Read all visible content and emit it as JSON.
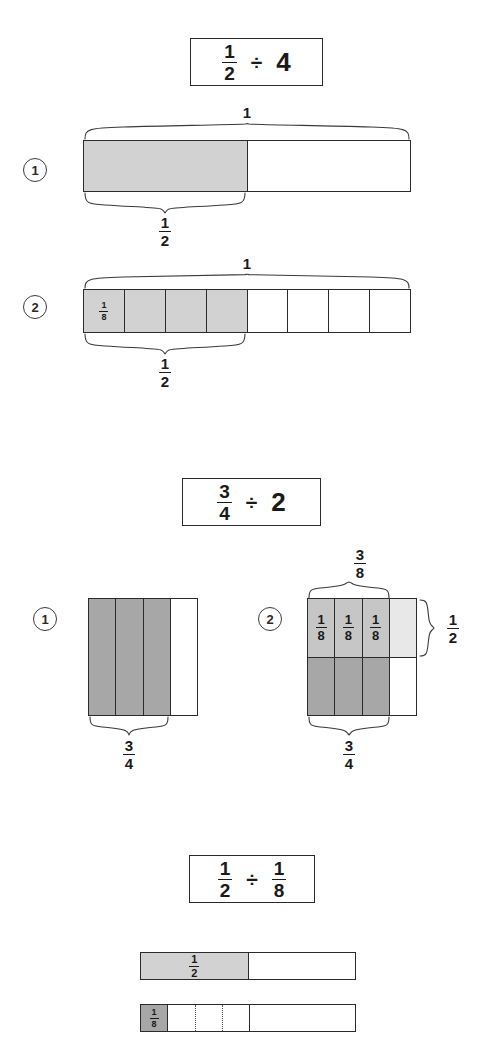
{
  "page": {
    "colors": {
      "ink": "#2b2b2b",
      "shade_light": "#d2d2d2",
      "shade_lighter": "#e8e8e8",
      "shade_mid": "#c6c6c6",
      "shade_dark": "#a7a7a7"
    }
  },
  "problems": [
    {
      "id": "problem-1",
      "expression": {
        "dividend": {
          "numerator": "1",
          "denominator": "2"
        },
        "operator": "÷",
        "divisor_whole": "4"
      },
      "steps": [
        {
          "number": "1",
          "model": "bar",
          "cells": 2,
          "shaded": 1,
          "cell_label": "",
          "top_brace_label": "1",
          "bottom_brace": {
            "numerator": "1",
            "denominator": "2"
          }
        },
        {
          "number": "2",
          "model": "bar",
          "cells": 8,
          "shaded": 4,
          "cell_label": {
            "numerator": "1",
            "denominator": "8"
          },
          "top_brace_label": "1",
          "bottom_brace": {
            "numerator": "1",
            "denominator": "2"
          }
        }
      ]
    },
    {
      "id": "problem-2",
      "expression": {
        "dividend": {
          "numerator": "3",
          "denominator": "4"
        },
        "operator": "÷",
        "divisor_whole": "2"
      },
      "steps": [
        {
          "number": "1",
          "model": "columns",
          "columns": 4,
          "shaded": 3,
          "bottom_brace": {
            "numerator": "3",
            "denominator": "4"
          }
        },
        {
          "number": "2",
          "model": "grid",
          "columns": 4,
          "rows": 2,
          "cell_labels": [
            {
              "numerator": "1",
              "denominator": "8"
            },
            {
              "numerator": "1",
              "denominator": "8"
            },
            {
              "numerator": "1",
              "denominator": "8"
            }
          ],
          "top_brace": {
            "numerator": "3",
            "denominator": "8"
          },
          "bottom_brace": {
            "numerator": "3",
            "denominator": "4"
          },
          "right_brace": {
            "numerator": "1",
            "denominator": "2"
          }
        }
      ]
    },
    {
      "id": "problem-3",
      "expression": {
        "dividend": {
          "numerator": "1",
          "denominator": "2"
        },
        "operator": "÷",
        "divisor_fraction": {
          "numerator": "1",
          "denominator": "8"
        }
      },
      "bars": [
        {
          "id": "bar-half",
          "cells": 2,
          "shaded": 1,
          "label": {
            "numerator": "1",
            "denominator": "2"
          }
        },
        {
          "id": "bar-eighths",
          "cells": 8,
          "shaded": 1,
          "label": {
            "numerator": "1",
            "denominator": "8"
          },
          "dotted_dividers": 3
        }
      ]
    }
  ]
}
